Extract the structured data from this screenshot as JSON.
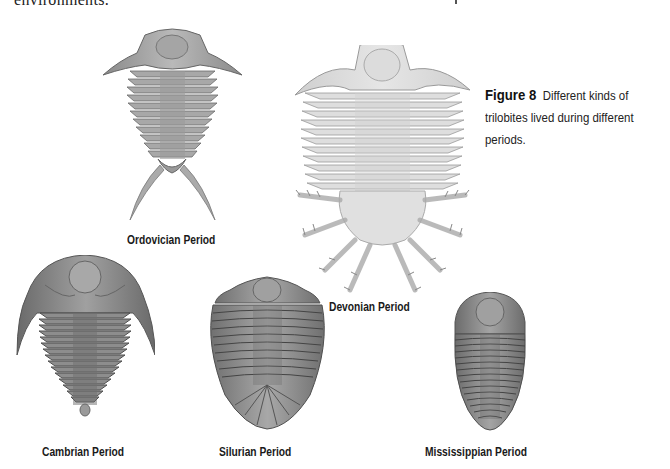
{
  "page": {
    "partial_top_text": "environments."
  },
  "figure": {
    "number": "Figure 8",
    "caption": "Different kinds of trilobites lived during different periods.",
    "caption_lines": [
      "Different kinds of",
      "trilobites lived during different",
      "periods."
    ]
  },
  "trilobites": [
    {
      "id": "ordovician",
      "label": "Ordovician Period",
      "illustration": "trilobite-ordovician-illustration"
    },
    {
      "id": "devonian",
      "label": "Devonian Period",
      "illustration": "trilobite-devonian-illustration"
    },
    {
      "id": "cambrian",
      "label": "Cambrian Period",
      "illustration": "trilobite-cambrian-illustration"
    },
    {
      "id": "silurian",
      "label": "Silurian Period",
      "illustration": "trilobite-silurian-illustration"
    },
    {
      "id": "mississippian",
      "label": "Mississippian Period",
      "illustration": "trilobite-mississippian-illustration"
    }
  ],
  "colors": {
    "background": "#ffffff",
    "text": "#1a1a1a",
    "trilobite_dark": "#6f6f6f",
    "trilobite_light": "#d8d8d8"
  }
}
